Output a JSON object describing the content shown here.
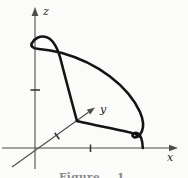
{
  "figure": {
    "kind": "3d-coordinate-sketch",
    "axes": {
      "x_label": "x",
      "y_label": "y",
      "z_label": "z",
      "ticks_per_axis": 1
    },
    "caption": "Figure 1.",
    "colors": {
      "background": "#fbfbf9",
      "curve": "#141414",
      "axis": "#4d4d4d",
      "tick": "#3a3a3a",
      "label": "#1e1e1e",
      "caption": "#8a8a8a"
    }
  }
}
